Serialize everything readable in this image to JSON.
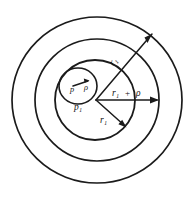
{
  "figure": {
    "background_color": "#ffffff",
    "ink_color": "#1b1b1b",
    "width": 195,
    "height": 200
  },
  "labels": {
    "outer_ray_label": "r₁",
    "horizontal_radius": "r₁",
    "horizontal_plus": "+",
    "horizontal_rho": "ρ",
    "small_circle_center": "p",
    "small_circle_radius": "ρ",
    "inner_circle_center": "p₁",
    "inner_circle_radius": "r₁"
  },
  "geometry": {
    "center": {
      "x": 97,
      "y": 100
    },
    "outer_circle_radius": 85,
    "middle_circle_radius": 62,
    "inner_circle": {
      "cx": 97,
      "cy": 100,
      "r": 40
    },
    "small_circle": {
      "cx": 78,
      "cy": 86,
      "r": 19
    },
    "diagonal_ray_angle_deg": -48,
    "horizontal_ray_length": 62,
    "inner_radius_ray_angle_deg": 42
  }
}
